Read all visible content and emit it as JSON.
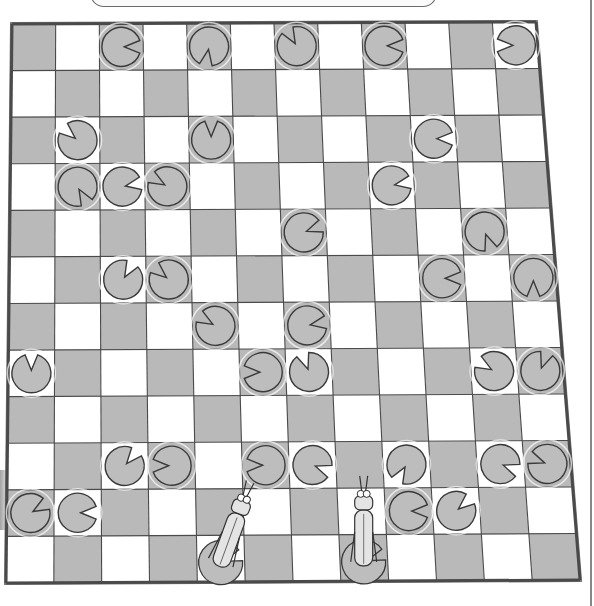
{
  "scene": {
    "title": "Grasshopper lily pad board puzzle",
    "colors": {
      "dark_square": "#b9b9b9",
      "light_square": "#ffffff",
      "grid_line": "#4a4a4a",
      "border": "#7a7a7a",
      "lily_pad": "#bdbdbd",
      "lily_pad_stroke": "#3a3a3a",
      "grasshopper": "#e4e4e4"
    }
  },
  "board": {
    "rows": 12,
    "cols": 12,
    "corners": {
      "top_left": [
        12,
        24
      ],
      "top_right": [
        536,
        22
      ],
      "bottom_left": [
        6,
        583
      ],
      "bottom_right": [
        580,
        580
      ]
    },
    "top_left_square": "dark"
  },
  "lily_pads": [
    {
      "row": 0,
      "col": 2,
      "notch_deg": 0
    },
    {
      "row": 0,
      "col": 4,
      "notch_deg": -100
    },
    {
      "row": 0,
      "col": 6,
      "notch_deg": 120
    },
    {
      "row": 0,
      "col": 8,
      "notch_deg": 0
    },
    {
      "row": 0,
      "col": 11,
      "notch_deg": 180
    },
    {
      "row": 2,
      "col": 1,
      "notch_deg": 140
    },
    {
      "row": 2,
      "col": 4,
      "notch_deg": 90
    },
    {
      "row": 2,
      "col": 9,
      "notch_deg": 0
    },
    {
      "row": 3,
      "col": 1,
      "notch_deg": -60
    },
    {
      "row": 3,
      "col": 2,
      "notch_deg": 10
    },
    {
      "row": 3,
      "col": 3,
      "notch_deg": 150
    },
    {
      "row": 3,
      "col": 8,
      "notch_deg": 10
    },
    {
      "row": 4,
      "col": 6,
      "notch_deg": 20
    },
    {
      "row": 4,
      "col": 10,
      "notch_deg": -70
    },
    {
      "row": 5,
      "col": 2,
      "notch_deg": 60
    },
    {
      "row": 5,
      "col": 3,
      "notch_deg": 140
    },
    {
      "row": 5,
      "col": 9,
      "notch_deg": 0
    },
    {
      "row": 5,
      "col": 11,
      "notch_deg": -90
    },
    {
      "row": 6,
      "col": 4,
      "notch_deg": 150
    },
    {
      "row": 6,
      "col": 6,
      "notch_deg": 10
    },
    {
      "row": 7,
      "col": 0,
      "notch_deg": 90
    },
    {
      "row": 7,
      "col": 5,
      "notch_deg": 180
    },
    {
      "row": 7,
      "col": 6,
      "notch_deg": 110
    },
    {
      "row": 7,
      "col": 10,
      "notch_deg": 150
    },
    {
      "row": 7,
      "col": 11,
      "notch_deg": 70
    },
    {
      "row": 9,
      "col": 2,
      "notch_deg": 50
    },
    {
      "row": 9,
      "col": 3,
      "notch_deg": 180
    },
    {
      "row": 9,
      "col": 5,
      "notch_deg": 180
    },
    {
      "row": 9,
      "col": 6,
      "notch_deg": -20
    },
    {
      "row": 9,
      "col": 8,
      "notch_deg": -120
    },
    {
      "row": 9,
      "col": 10,
      "notch_deg": -20
    },
    {
      "row": 9,
      "col": 11,
      "notch_deg": 160
    },
    {
      "row": 10,
      "col": 0,
      "notch_deg": 30
    },
    {
      "row": 10,
      "col": 1,
      "notch_deg": 0
    },
    {
      "row": 10,
      "col": 8,
      "notch_deg": 0
    },
    {
      "row": 10,
      "col": 9,
      "notch_deg": 40
    }
  ],
  "grasshoppers": [
    {
      "name": "grasshopper-1",
      "row": 11,
      "col": 4,
      "tilt_deg": 20
    },
    {
      "name": "grasshopper-2",
      "row": 11,
      "col": 7,
      "tilt_deg": 0
    }
  ]
}
